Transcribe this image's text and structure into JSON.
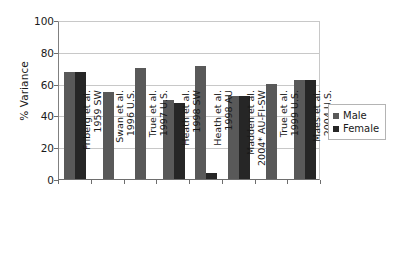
{
  "chart_data": {
    "type": "bar",
    "title": "",
    "xlabel": "",
    "ylabel": "% Variance",
    "ylim": [
      0,
      100
    ],
    "yticks": [
      0,
      20,
      40,
      60,
      80,
      100
    ],
    "grid": true,
    "legend_position": "right",
    "categories": [
      "Friberg et al. 1959 SW",
      "Swan et al. 1996 U.S.",
      "True et al. 1997 U.S.",
      "Heath et al. 1998 SW",
      "Heath et al. 1998 AU",
      "Madden et al. 2004* AU-FI-SW",
      "True et al. 1999 U.S.",
      "Maes et al. 2004 U.S."
    ],
    "category_lines": [
      [
        "Friberg et al.",
        "1959 SW"
      ],
      [
        "Swan et al.",
        "1996 U.S."
      ],
      [
        "True et al.",
        "1997 U.S."
      ],
      [
        "Heath et al.",
        "1998 SW"
      ],
      [
        "Heath et al.",
        "1998 AU"
      ],
      [
        "Madden et al.",
        "2004* AU-FI-SW"
      ],
      [
        "True et al.",
        "1999 U.S."
      ],
      [
        "Maes et al.",
        "2004 U.S."
      ]
    ],
    "series": [
      {
        "name": "Male",
        "color": "#595959",
        "values": [
          67,
          55,
          70,
          50,
          71,
          52,
          60,
          62
        ]
      },
      {
        "name": "Female",
        "color": "#262626",
        "values": [
          67,
          null,
          null,
          48,
          4,
          52,
          null,
          62
        ]
      }
    ]
  },
  "legend": {
    "items": [
      {
        "label": "Male"
      },
      {
        "label": "Female"
      }
    ]
  }
}
